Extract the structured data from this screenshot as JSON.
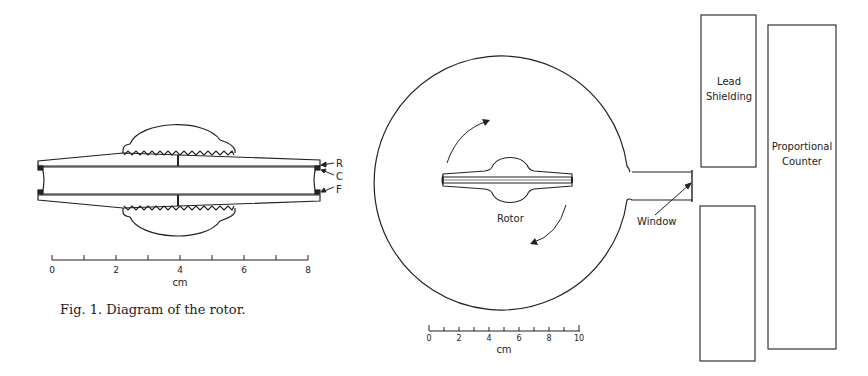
{
  "figure1": {
    "labels": {
      "r": "R",
      "c": "C",
      "f": "F"
    },
    "scale": {
      "ticks": [
        "0",
        "2",
        "4",
        "6",
        "8"
      ],
      "unit": "cm"
    },
    "caption": "Fig. 1.  Diagram of the rotor."
  },
  "figure2": {
    "rotor_label": "Rotor",
    "window_label": "Window",
    "lead_shielding": [
      "Lead",
      "Shielding"
    ],
    "proportional_counter": [
      "Proportional",
      "Counter"
    ],
    "scale": {
      "ticks": [
        "0",
        "2",
        "4",
        "6",
        "8",
        "10"
      ],
      "unit": "cm"
    }
  },
  "colors": {
    "ink": "#222222",
    "background": "#ffffff"
  }
}
